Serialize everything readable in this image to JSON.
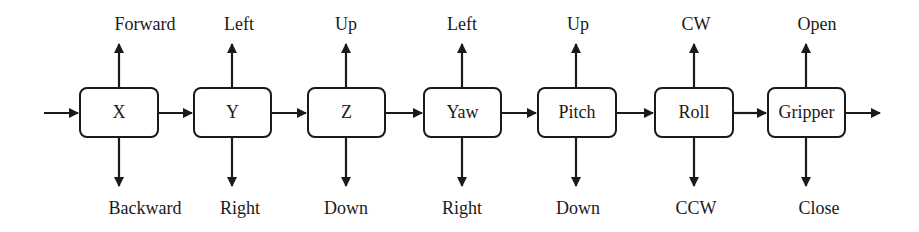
{
  "diagram": {
    "type": "block-flow",
    "direction": "left-to-right",
    "stages": [
      {
        "name": "X",
        "up": "Forward",
        "down": "Backward"
      },
      {
        "name": "Y",
        "up": "Left",
        "down": "Right"
      },
      {
        "name": "Z",
        "up": "Up",
        "down": "Down"
      },
      {
        "name": "Yaw",
        "up": "Left",
        "down": "Right"
      },
      {
        "name": "Pitch",
        "up": "Up",
        "down": "Down"
      },
      {
        "name": "Roll",
        "up": "CW",
        "down": "CCW"
      },
      {
        "name": "Gripper",
        "up": "Open",
        "down": "Close"
      }
    ]
  }
}
